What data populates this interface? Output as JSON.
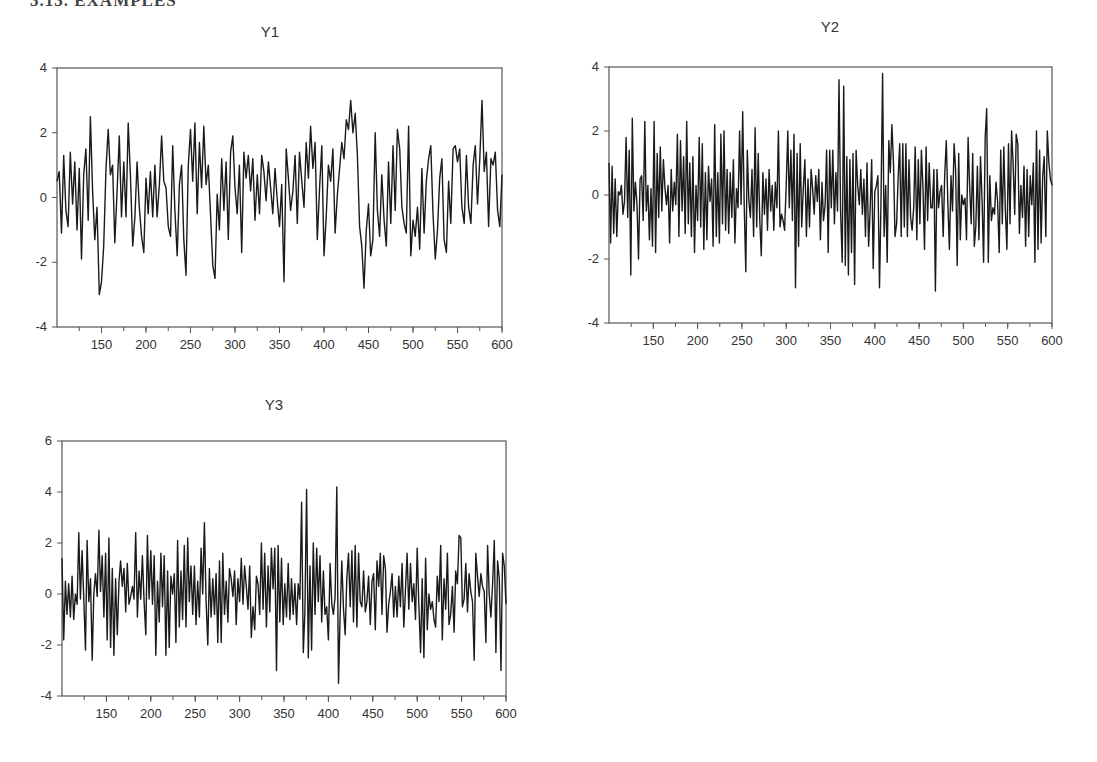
{
  "page": {
    "heading": "3.13.   EXAMPLES"
  },
  "chart_data": [
    {
      "type": "line",
      "title": "Y1",
      "xlabel": "",
      "ylabel": "",
      "xlim": [
        100,
        600
      ],
      "ylim": [
        -4,
        4
      ],
      "xticks": [
        150,
        200,
        250,
        300,
        350,
        400,
        450,
        500,
        550,
        600
      ],
      "xminor_step": 25,
      "yticks": [
        4,
        2,
        0,
        -2,
        -4
      ],
      "grid": false,
      "x_start": 100,
      "x_step": 5,
      "values": [
        0.5,
        0.8,
        -1.1,
        1.3,
        -0.4,
        -0.9,
        1.4,
        -0.2,
        1.1,
        -1.0,
        0.9,
        -1.9,
        0.7,
        1.5,
        -0.7,
        2.5,
        0.2,
        -1.3,
        -0.3,
        -3.0,
        -2.6,
        -1.5,
        0.9,
        2.1,
        0.7,
        1.0,
        -1.4,
        0.2,
        1.9,
        -0.6,
        1.1,
        -0.6,
        2.3,
        0.7,
        -1.5,
        -0.6,
        1.1,
        -0.3,
        -1.2,
        -1.7,
        0.6,
        -0.5,
        0.8,
        -0.6,
        1.0,
        -0.6,
        0.4,
        1.9,
        0.5,
        0.3,
        -0.9,
        -1.2,
        1.6,
        -0.4,
        -1.8,
        0.4,
        1.0,
        -1.3,
        -2.4,
        1.0,
        2.1,
        0.5,
        2.3,
        -0.5,
        1.7,
        0.3,
        2.2,
        0.4,
        1.0,
        -0.5,
        -2.1,
        -2.5,
        0.1,
        -1.0,
        1.2,
        -0.4,
        1.1,
        -1.3,
        1.4,
        1.9,
        0.3,
        -0.5,
        1.0,
        -1.7,
        1.4,
        0.6,
        1.3,
        0.2,
        1.2,
        -0.7,
        0.7,
        -0.5,
        1.3,
        0.8,
        -0.1,
        1.1,
        0.3,
        -0.5,
        0.9,
        -0.1
      ],
      "values_b": [
        -0.9,
        0.4,
        -2.6,
        1.5,
        0.6,
        -0.4,
        0.2,
        1.3,
        -0.8,
        1.4,
        0.5,
        -0.3,
        1.7,
        0.6,
        2.2,
        0.9,
        1.7,
        -1.3,
        0.3,
        1.6,
        -1.8,
        -0.6,
        1.0,
        0.5,
        1.5,
        -1.1,
        0.1,
        0.9,
        1.7,
        1.2,
        2.4,
        2.1,
        3.0,
        2.0,
        2.6,
        1.3,
        -0.9,
        -1.5,
        -2.8,
        -1.0,
        -0.2,
        -1.8,
        -1.3,
        2.0,
        -0.4,
        -1.2,
        0.7,
        -0.7,
        -1.5,
        1.1,
        -0.8,
        1.6,
        -0.4,
        2.1,
        1.5,
        -0.3,
        -0.8,
        -1.1,
        2.2,
        -1.8,
        -0.7,
        -1.2,
        -0.3,
        -1.6,
        0.9,
        -1.1,
        0.5,
        1.2,
        1.6,
        -0.5,
        -1.9,
        -1.0,
        0.6,
        1.2,
        -1.3,
        -1.7,
        0.5,
        -0.8,
        1.5,
        1.6,
        1.1,
        1.5,
        -0.3,
        -0.8,
        1.3,
        -0.3,
        -0.8,
        1.0,
        1.6,
        -0.2,
        1.2,
        3.0,
        0.8,
        1.4,
        -0.9,
        1.2,
        1.0,
        1.4,
        -0.4,
        -0.9,
        0.7
      ]
    },
    {
      "type": "line",
      "title": "Y2",
      "xlabel": "",
      "ylabel": "",
      "xlim": [
        100,
        600
      ],
      "ylim": [
        -4,
        4
      ],
      "xticks": [
        150,
        200,
        250,
        300,
        350,
        400,
        450,
        500,
        550,
        600
      ],
      "xminor_step": 25,
      "yticks": [
        4,
        2,
        0,
        -2,
        -4
      ],
      "grid": false,
      "x_start": 100,
      "x_step": 2.5,
      "values": [
        1.0,
        -1.5,
        0.9,
        -1.2,
        0.5,
        -1.3,
        0.1,
        0.0,
        0.3,
        -0.6,
        -0.2,
        1.8,
        -0.7,
        1.4,
        -2.5,
        2.4,
        -0.5,
        0.4,
        -0.3,
        -2.0,
        0.5,
        0.6,
        -0.8,
        2.3,
        -0.5,
        0.3,
        -1.4,
        0.2,
        -1.6,
        2.3,
        -1.8,
        1.3,
        -0.7,
        1.5,
        -0.5,
        1.1,
        0.2,
        -0.3,
        0.3,
        -1.5,
        0.8,
        -0.5,
        0.4,
        -0.3,
        1.9,
        -1.3,
        1.7,
        -0.5,
        1.2,
        -1.2,
        2.3,
        -0.9,
        1.0,
        -1.3,
        1.2,
        -1.8,
        0.3,
        -0.8,
        1.8,
        -1.0,
        1.6,
        -1.7,
        0.7,
        -1.4,
        0.9,
        -0.2,
        0.5,
        -1.6,
        2.2,
        -1.3,
        0.7,
        -1.5,
        1.9,
        -0.9,
        2.0,
        -1.1,
        0.8,
        -1.2,
        0.7,
        -0.7,
        1.1,
        -1.5,
        0.2,
        -0.4,
        2.0,
        -0.3,
        2.6,
        -0.3,
        -2.4,
        1.4,
        -0.2,
        -0.7,
        0.8,
        -1.3,
        2.1,
        -1.0,
        1.3,
        -0.8,
        -1.9,
        0.7,
        -0.6,
        0.5,
        -1.1,
        0.8,
        -0.5,
        0.3,
        -1.1,
        0.4,
        -0.4,
        2.0,
        -1.0,
        -0.6,
        -0.8,
        -1.1,
        0.3,
        2.0,
        -0.4,
        1.4,
        -0.8,
        1.9,
        -2.9,
        1.3,
        -1.6,
        1.6,
        -1.0,
        0.2,
        1.1,
        -1.3,
        0.5,
        -1.0,
        0.8,
        0.2,
        -0.6,
        0.6,
        -0.2,
        0.8,
        -1.4,
        0.4,
        -0.8,
        -0.3,
        1.4,
        -1.8,
        1.4,
        -0.4,
        1.4,
        -0.9,
        0.7,
        -0.5,
        3.6,
        -0.5,
        -2.1,
        3.4,
        -2.2,
        1.2,
        -2.5,
        1.1,
        -1.8,
        1.3,
        -2.8,
        1.4,
        0.3,
        -0.3,
        0.8,
        -0.6,
        0.5,
        -1.3,
        1.0,
        -1.6,
        -0.5,
        1.1,
        -2.3,
        0.1,
        0.3,
        0.6,
        -2.9,
        -0.2,
        3.8,
        -1.3,
        0.3,
        -2.1,
        1.7,
        0.7,
        2.2,
        1.0,
        -1.3,
        -0.9,
        0.5,
        1.6,
        -1.3,
        1.6,
        -1.0,
        1.6,
        -1.3,
        1.1,
        -0.7,
        -1.1,
        -0.4,
        1.5,
        -1.4,
        1.1,
        -0.9,
        1.4,
        0.2,
        -1.7,
        1.5,
        -0.8,
        1.0,
        -0.4,
        -0.4,
        0.8,
        -3.0,
        0.8,
        -0.4,
        0.1,
        0.3,
        -1.3,
        0.6,
        1.7,
        -0.3,
        -1.7,
        0.6,
        -0.5,
        1.6,
        0.8,
        -2.2,
        1.3,
        -1.4,
        0.0,
        -0.3,
        -0.1,
        -1.4,
        1.8,
        0.3,
        -0.9,
        1.3,
        -1.6,
        -1.0,
        0.9,
        -1.4,
        1.2,
        -0.2,
        -2.1,
        1.8,
        2.7,
        -2.1,
        0.6,
        -0.8,
        -0.4,
        -0.6,
        0.4,
        -0.2,
        -1.8,
        1.4,
        -0.9,
        1.5,
        -0.5,
        -1.7,
        1.6,
        -0.9,
        2.0,
        1.0,
        -0.6,
        1.9,
        1.6,
        -1.2,
        0.3,
        -0.7,
        0.9,
        -1.6,
        0.8,
        -1.3,
        0.6,
        -0.3,
        1.0,
        -2.1,
        2.0,
        -1.7,
        1.4,
        -1.5,
        0.6,
        1.2,
        -1.3,
        2.0,
        1.0,
        0.5,
        0.3
      ],
      "values_b": []
    },
    {
      "type": "line",
      "title": "Y3",
      "xlabel": "",
      "ylabel": "",
      "xlim": [
        100,
        600
      ],
      "ylim": [
        -4,
        6
      ],
      "xticks": [
        150,
        200,
        250,
        300,
        350,
        400,
        450,
        500,
        550,
        600
      ],
      "xminor_step": 25,
      "yticks": [
        6,
        4,
        2,
        0,
        -2,
        -4
      ],
      "grid": false,
      "x_start": 100,
      "x_step": 2.5,
      "values": [
        1.4,
        -1.8,
        0.5,
        -0.8,
        0.4,
        -0.9,
        0.7,
        -1.0,
        0.0,
        -0.4,
        2.4,
        -0.2,
        1.7,
        -0.2,
        -2.2,
        2.1,
        -0.3,
        0.6,
        -2.6,
        0.0,
        0.8,
        -0.1,
        2.5,
        0.1,
        1.5,
        -0.9,
        1.6,
        -1.8,
        2.2,
        -2.1,
        1.0,
        -2.4,
        0.6,
        -1.6,
        0.5,
        1.3,
        0.3,
        1.0,
        -0.7,
        1.2,
        -0.4,
        -0.1,
        0.3,
        -0.2,
        2.4,
        -0.9,
        0.9,
        -0.2,
        1.5,
        -0.3,
        -1.6,
        2.3,
        -0.2,
        1.7,
        -0.4,
        1.5,
        -2.4,
        0.5,
        -1.1,
        1.6,
        -0.5,
        1.5,
        -2.4,
        0.9,
        -2.1,
        0.7,
        0.0,
        0.8,
        -1.9,
        2.1,
        -1.3,
        0.9,
        -1.0,
        1.9,
        -1.3,
        2.2,
        -0.3,
        1.1,
        -0.8,
        1.1,
        -1.2,
        0.5,
        -0.9,
        1.8,
        0.0,
        2.8,
        -0.3,
        -2.0,
        1.0,
        -0.9,
        0.6,
        -0.8,
        0.8,
        -1.9,
        1.3,
        -1.9,
        1.6,
        -0.8,
        0.5,
        -1.1,
        1.0,
        0.6,
        -0.1,
        0.9,
        -1.2,
        0.6,
        -0.3,
        1.4,
        -0.4,
        1.1,
        0.3,
        -0.6,
        1.1,
        -1.7,
        -0.5,
        -1.4,
        0.7,
        0.4,
        -0.8,
        2.0,
        -0.6,
        1.6,
        -1.3,
        1.1,
        -0.7,
        1.8,
        0.2,
        1.8,
        -3.0,
        1.9,
        -1.1,
        1.4,
        -1.2,
        0.4,
        -0.9,
        1.2,
        -1.0,
        0.6,
        -0.8,
        0.4,
        -1.2,
        0.4,
        -0.2,
        3.6,
        -2.3,
        -0.7,
        4.1,
        -2.5,
        1.1,
        -2.2,
        2.0,
        -0.8,
        1.8,
        -0.3,
        1.5,
        -1.1,
        0.9,
        -0.8,
        -0.5,
        -1.8,
        1.2,
        -0.4,
        -0.8,
        -0.1,
        4.2,
        -3.5,
        -0.9,
        1.3,
        -0.6,
        -1.6,
        0.6,
        1.6,
        -0.5,
        1.7,
        -1.1,
        1.9,
        -1.3,
        1.6,
        -0.3,
        -0.5,
        0.9,
        -0.7,
        -0.3,
        0.7,
        -1.2,
        0.5,
        0.8,
        -1.4,
        1.3,
        0.3,
        1.6,
        -0.8,
        1.5,
        1.0,
        -1.5,
        -0.4,
        0.1,
        0.8,
        -0.9,
        0.3,
        -0.9,
        0.7,
        -0.5,
        1.2,
        -1.3,
        0.2,
        1.6,
        -0.6,
        1.2,
        -0.3,
        0.4,
        -1.0,
        1.8,
        -0.5,
        -2.3,
        0.6,
        -2.5,
        1.4,
        -1.4,
        0.0,
        -0.6,
        -0.3,
        -1.0,
        -1.3,
        0.7,
        -0.3,
        1.9,
        -1.8,
        0.6,
        -0.6,
        1.6,
        -1.2,
        -0.8,
        0.3,
        -1.5,
        0.9,
        0.4,
        2.3,
        2.2,
        -0.5,
        -0.2,
        1.2,
        -0.7,
        0.8,
        0.1,
        -0.3,
        -2.6,
        1.6,
        0.7,
        -0.1,
        0.8,
        0.3,
        0.1,
        -1.9,
        1.9,
        0.0,
        -0.9,
        0.4,
        2.1,
        -2.3,
        1.3,
        0.6,
        -3.0,
        1.6,
        1.1,
        -0.4
      ]
    }
  ]
}
